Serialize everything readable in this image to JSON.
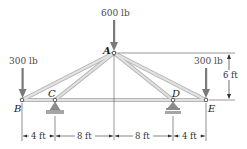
{
  "diagram": {
    "type": "roof truss with loads",
    "nodes": {
      "A": {
        "label": "A",
        "x": 114,
        "y": 53
      },
      "B": {
        "label": "B",
        "x": 22,
        "y": 100
      },
      "C": {
        "label": "C",
        "x": 55,
        "y": 100
      },
      "D": {
        "label": "D",
        "x": 173,
        "y": 100
      },
      "E": {
        "label": "E",
        "x": 206,
        "y": 100
      }
    },
    "members": [
      "AB",
      "AC",
      "AD",
      "AE",
      "BC",
      "CD",
      "DE"
    ],
    "supports": {
      "C": "pin",
      "D": "roller"
    },
    "loads": {
      "A": {
        "label": "600 lb"
      },
      "B": {
        "label": "300 lb"
      },
      "E": {
        "label": "300 lb"
      }
    },
    "dimensions": {
      "height": "6 ft",
      "spans": [
        "4 ft",
        "8 ft",
        "8 ft",
        "4 ft"
      ]
    },
    "colors": {
      "member_fill": "#d9d9d9",
      "member_edge": "#a8a8a8",
      "arrow": "#7a7a7a",
      "support": "#9a9a9a"
    }
  }
}
